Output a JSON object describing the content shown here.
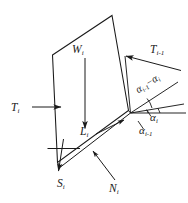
{
  "figure": {
    "kind": "free-body-diagram",
    "background_color": "#ffffff",
    "line_color": "#1a1a1a",
    "text_color": "#1a1a1a"
  },
  "labels": {
    "weight": {
      "symbol": "W",
      "subscript": "i"
    },
    "interslice_right": {
      "symbol": "T",
      "subscript": "i-1"
    },
    "interslice_left": {
      "symbol": "T",
      "subscript": "i"
    },
    "base_length": {
      "symbol": "L",
      "subscript": "i"
    },
    "shear_force": {
      "symbol": "S",
      "subscript": "i"
    },
    "normal_force": {
      "symbol": "N",
      "subscript": "i"
    },
    "angle_i": {
      "symbol": "α",
      "subscript": "i"
    },
    "angle_i_minus_1": {
      "symbol": "α",
      "subscript": "i-1"
    },
    "angle_difference": {
      "first_symbol": "α",
      "first_subscript": "i-1",
      "operator": "−",
      "second_symbol": "α",
      "second_subscript": "i"
    }
  }
}
